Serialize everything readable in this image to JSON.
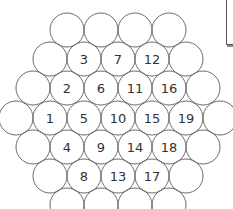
{
  "diagram": {
    "type": "hexagonal-circle-packing",
    "circle_radius": 17,
    "stroke_color": "#6b6b6b",
    "label_color": "#333333",
    "rows": [
      {
        "y": 30,
        "circles": [
          {
            "x": 67,
            "label": ""
          },
          {
            "x": 101,
            "label": ""
          },
          {
            "x": 135,
            "label": ""
          },
          {
            "x": 169,
            "label": ""
          }
        ]
      },
      {
        "y": 59,
        "circles": [
          {
            "x": 50,
            "label": ""
          },
          {
            "x": 84,
            "label": "3"
          },
          {
            "x": 118,
            "label": "7"
          },
          {
            "x": 152,
            "label": "12"
          },
          {
            "x": 186,
            "label": ""
          }
        ]
      },
      {
        "y": 88,
        "circles": [
          {
            "x": 33,
            "label": ""
          },
          {
            "x": 67,
            "label": "2"
          },
          {
            "x": 101,
            "label": "6"
          },
          {
            "x": 135,
            "label": "11"
          },
          {
            "x": 169,
            "label": "16"
          },
          {
            "x": 203,
            "label": ""
          }
        ]
      },
      {
        "y": 118,
        "circles": [
          {
            "x": 16,
            "label": ""
          },
          {
            "x": 50,
            "label": "1"
          },
          {
            "x": 84,
            "label": "5"
          },
          {
            "x": 118,
            "label": "10"
          },
          {
            "x": 152,
            "label": "15"
          },
          {
            "x": 186,
            "label": "19"
          },
          {
            "x": 220,
            "label": ""
          }
        ]
      },
      {
        "y": 147,
        "circles": [
          {
            "x": 33,
            "label": ""
          },
          {
            "x": 67,
            "label": "4"
          },
          {
            "x": 101,
            "label": "9"
          },
          {
            "x": 135,
            "label": "14"
          },
          {
            "x": 169,
            "label": "18"
          },
          {
            "x": 203,
            "label": ""
          }
        ]
      },
      {
        "y": 176,
        "circles": [
          {
            "x": 50,
            "label": ""
          },
          {
            "x": 84,
            "label": "8"
          },
          {
            "x": 118,
            "label": "13"
          },
          {
            "x": 152,
            "label": "17"
          },
          {
            "x": 186,
            "label": ""
          }
        ]
      },
      {
        "y": 205,
        "circles": [
          {
            "x": 67,
            "label": ""
          },
          {
            "x": 101,
            "label": ""
          },
          {
            "x": 135,
            "label": ""
          },
          {
            "x": 169,
            "label": ""
          }
        ]
      }
    ]
  }
}
